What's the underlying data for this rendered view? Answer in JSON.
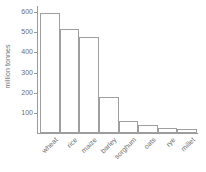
{
  "chart_data": {
    "type": "bar",
    "title": "",
    "subtitle": "",
    "xlabel": "",
    "ylabel": "million tonnes",
    "categories": [
      "wheat",
      "rice",
      "maize",
      "barley",
      "sorghum",
      "oats",
      "rye",
      "millet"
    ],
    "values": [
      597,
      518,
      476,
      178,
      60,
      40,
      26,
      18
    ],
    "ylim": [
      0,
      620
    ],
    "yticks": [
      100,
      200,
      300,
      400,
      500,
      600
    ],
    "ytick_labels": [
      "100",
      "200",
      "300",
      "400",
      "500",
      "600"
    ],
    "grid": false,
    "legend": null,
    "legend_position": "none",
    "bar_fill": "#ffffff",
    "bar_edge": "#9f9f9f",
    "axis_color": "#9a9a9a",
    "text_color": "#6d6d6d",
    "background": "#ffffff"
  },
  "axes": {
    "y_title": "million tonnes"
  }
}
